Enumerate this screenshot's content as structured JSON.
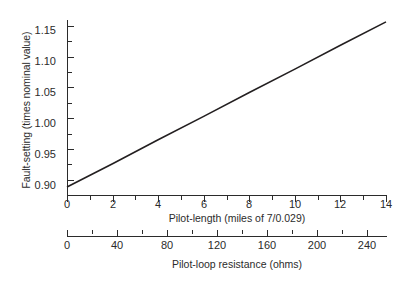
{
  "chart_data": {
    "type": "line",
    "title": "",
    "subtitle": "",
    "ylabel": "Fault-setting (times nominal value)",
    "xlabel": "Pilot-length (miles of 7/0.029)",
    "xlabel_secondary": "Pilot-loop resistance (ohms)",
    "xlim": [
      0,
      14
    ],
    "ylim": [
      0.875,
      1.16
    ],
    "xlim_secondary": [
      0,
      255
    ],
    "grid": false,
    "legend": null,
    "legend_position": "none",
    "line_color": "#231f20",
    "axis_color": "#2b2b2b",
    "background": "#ffffff",
    "x_major_ticks": [
      0,
      2,
      4,
      6,
      8,
      10,
      12,
      14
    ],
    "x_minor_ticks": [
      1,
      3,
      5,
      7,
      9,
      11,
      13
    ],
    "x_tick_labels": [
      "0",
      "2",
      "4",
      "6",
      "8",
      "10",
      "12",
      "14"
    ],
    "y_major_ticks": [
      0.9,
      0.95,
      1.0,
      1.05,
      1.1,
      1.15
    ],
    "y_minor_ticks": [
      0.925,
      0.975,
      1.025,
      1.075,
      1.125
    ],
    "y_tick_labels": [
      "0.90",
      "0.95",
      "1.00",
      "1.05",
      "1.10",
      "1.15"
    ],
    "x2_major_ticks": [
      0,
      40,
      80,
      120,
      160,
      200,
      240
    ],
    "x2_minor_ticks": [
      20,
      60,
      100,
      140,
      180,
      220
    ],
    "x2_tick_labels": [
      "0",
      "40",
      "80",
      "120",
      "160",
      "200",
      "240"
    ],
    "series": [
      {
        "name": "Fault setting vs pilot length",
        "x": [
          0,
          2,
          4,
          6,
          8,
          10,
          12,
          14
        ],
        "y": [
          0.888,
          0.926,
          0.965,
          1.003,
          1.042,
          1.08,
          1.119,
          1.157
        ],
        "slope_per_mile": 0.0192,
        "intercept": 0.888
      }
    ]
  }
}
